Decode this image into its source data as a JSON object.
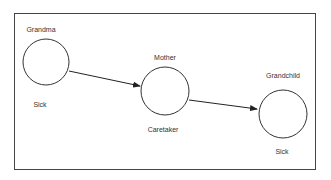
{
  "diagram": {
    "type": "flow",
    "nodes": [
      {
        "id": "grandma",
        "title": "Grandma",
        "status": "Sick"
      },
      {
        "id": "mother",
        "title": "Mother",
        "status": "Caretaker"
      },
      {
        "id": "grandchild",
        "title": "Grandchild",
        "status": "Sick"
      }
    ],
    "edges": [
      {
        "from": "grandma",
        "to": "mother"
      },
      {
        "from": "mother",
        "to": "grandchild"
      }
    ],
    "colors": {
      "stroke": "#333333",
      "background": "#ffffff"
    }
  }
}
